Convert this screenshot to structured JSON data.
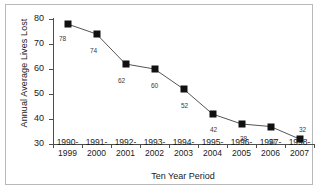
{
  "chart_data": {
    "type": "line",
    "title": "",
    "xlabel": "Ten Year Period",
    "ylabel": "Annual Average Lives Lost",
    "categories": [
      "1990-1999",
      "1991-2000",
      "1992-2001",
      "1993-2002",
      "1994-2003",
      "1995-2004",
      "1996-2005",
      "1997-2006",
      "1998-2007"
    ],
    "category_lines": [
      [
        "1990-",
        "1999"
      ],
      [
        "1991-",
        "2000"
      ],
      [
        "1992-",
        "2001"
      ],
      [
        "1993-",
        "2002"
      ],
      [
        "1994-",
        "2003"
      ],
      [
        "1995-",
        "2004"
      ],
      [
        "1996-",
        "2005"
      ],
      [
        "1997-",
        "2006"
      ],
      [
        "1998-",
        "2007"
      ]
    ],
    "values": [
      78,
      74,
      62,
      60,
      52,
      42,
      38,
      37,
      32
    ],
    "point_labels": [
      "78",
      "74",
      "62",
      "60",
      "52",
      "42",
      "38",
      "37",
      "32"
    ],
    "ylim": [
      30,
      80
    ],
    "yticks": [
      80,
      70,
      60,
      50,
      40,
      30
    ],
    "ytick_labels": [
      "80",
      "70",
      "60",
      "50",
      "40",
      "30"
    ],
    "grid": false,
    "legend": false,
    "marker": "filled-square",
    "series_color": "#111111",
    "line_color": "#555555",
    "border_color": "#b9b9b9",
    "background": "#ffffff"
  }
}
